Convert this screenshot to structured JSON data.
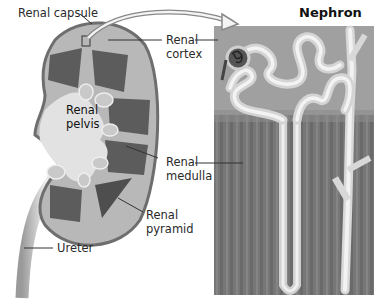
{
  "title": "Nephron",
  "labels": {
    "renal_capsule": "Renal capsule",
    "renal_cortex_1": "Renal",
    "renal_cortex_2": "cortex",
    "renal_pelvis_1": "Renal",
    "renal_pelvis_2": "pelvis",
    "renal_medulla_1": "Renal",
    "renal_medulla_2": "medulla",
    "renal_pyramid_1": "Renal",
    "renal_pyramid_2": "pyramid",
    "ureter": "Ureter"
  },
  "colors": {
    "capsule": "#7a7a7a",
    "cortex": "#b9b9b9",
    "medulla": "#5a5a5a",
    "pelvis": "#dcdcdc",
    "nephron_bg_top": "#9a9a9a",
    "nephron_bg_bottom": "#6e6e6e",
    "tubule": "#e6e6e6"
  }
}
